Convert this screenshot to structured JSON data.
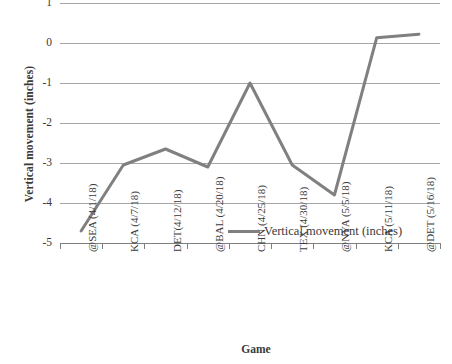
{
  "chart_data": {
    "type": "line",
    "title": "",
    "xlabel": "Game",
    "ylabel": "Vertical movement (inches)",
    "ylim": [
      -5,
      1
    ],
    "yticks": [
      1,
      0,
      -1,
      -2,
      -3,
      -4,
      -5
    ],
    "ytick_labels": [
      "1",
      "0",
      "-1",
      "-2",
      "-3",
      "-4",
      "-5"
    ],
    "grid": true,
    "legend_position": "inside-bottom-right",
    "series_color": "#808080",
    "gridline_color": "#a6a6a6",
    "categories": [
      "@SEA (4/1/18)",
      "KCA (4/7/18)",
      "DET(4/12/18)",
      "@BAL (4/20/18)",
      "CHN (4/25/18)",
      "TEX (4/30/18)",
      "@NYA (5/5/18)",
      "KCA (5/11/18)",
      "@DET (5/16/18)"
    ],
    "series": [
      {
        "name": "Vertical movement (inches)",
        "values": [
          -4.7,
          -3.05,
          -2.65,
          -3.1,
          -1.0,
          -3.05,
          -3.8,
          0.13,
          0.22
        ]
      }
    ]
  },
  "legend": {
    "entries": [
      {
        "label": "Vertical movement (inches)",
        "color": "#808080"
      }
    ]
  }
}
